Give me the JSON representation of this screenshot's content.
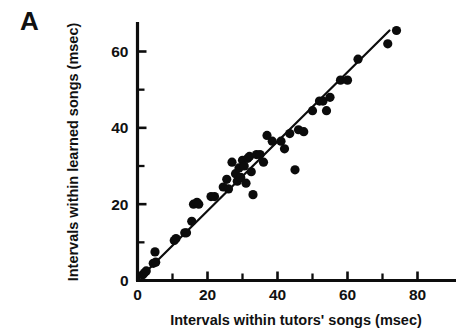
{
  "figure": {
    "panel_label": "A",
    "background_color": "#ffffff",
    "ink_color": "#0d0d0d"
  },
  "chart_data": {
    "type": "scatter",
    "title": "",
    "subtitle": "",
    "panel": "A",
    "xlabel": "Intervals within tutors' songs (msec)",
    "ylabel": "Intervals within learned songs (msec)",
    "xlim": [
      0,
      84
    ],
    "ylim": [
      0,
      70
    ],
    "xticks": [
      0,
      20,
      40,
      60,
      80
    ],
    "xtick_labels": [
      "0",
      "20",
      "40",
      "60",
      "80"
    ],
    "xticks_minor": [
      10,
      30,
      50,
      70
    ],
    "yticks": [
      0,
      20,
      40,
      60
    ],
    "ytick_labels": [
      "0",
      "20",
      "40",
      "60"
    ],
    "yticks_minor": [
      10,
      30,
      50,
      70
    ],
    "grid": false,
    "legend": null,
    "marker": "filled-circle",
    "marker_color": "#0b0b0b",
    "marker_size_px": 4.6,
    "series": [
      {
        "name": "song interval pairs",
        "x": [
          1.5,
          2.0,
          2.5,
          4.5,
          5.0,
          5.2,
          10.5,
          11.0,
          13.5,
          14.0,
          15.5,
          16.0,
          17.0,
          17.5,
          21.0,
          22.0,
          24.5,
          25.5,
          26.0,
          27.0,
          28.0,
          28.5,
          29.0,
          29.5,
          30.0,
          30.5,
          31.0,
          31.5,
          32.0,
          32.5,
          33.0,
          34.0,
          35.0,
          36.0,
          37.0,
          38.5,
          41.0,
          42.0,
          43.5,
          45.0,
          46.0,
          47.5,
          50.0,
          52.0,
          53.0,
          54.0,
          55.0,
          58.0,
          60.0,
          63.0,
          71.5,
          74.0
        ],
        "y": [
          1.5,
          2.0,
          2.5,
          4.5,
          7.5,
          4.8,
          10.5,
          11.0,
          12.5,
          12.5,
          15.5,
          20.0,
          20.5,
          20.0,
          22.0,
          22.0,
          24.5,
          26.5,
          24.0,
          31.0,
          28.0,
          26.0,
          29.5,
          27.0,
          31.5,
          30.0,
          25.5,
          32.0,
          32.5,
          28.5,
          22.5,
          33.0,
          33.0,
          31.0,
          38.0,
          36.5,
          36.5,
          34.5,
          38.5,
          29.0,
          39.5,
          39.0,
          44.5,
          47.0,
          47.0,
          44.5,
          48.0,
          52.5,
          52.5,
          58.0,
          62.0,
          65.5
        ]
      }
    ],
    "fit_line": {
      "type": "linear-regression",
      "x_start": 0.5,
      "y_start": 0.5,
      "x_end": 72.0,
      "y_end": 65.5
    }
  },
  "axes": {
    "x_axis_name": "x-axis",
    "y_axis_name": "y-axis"
  }
}
